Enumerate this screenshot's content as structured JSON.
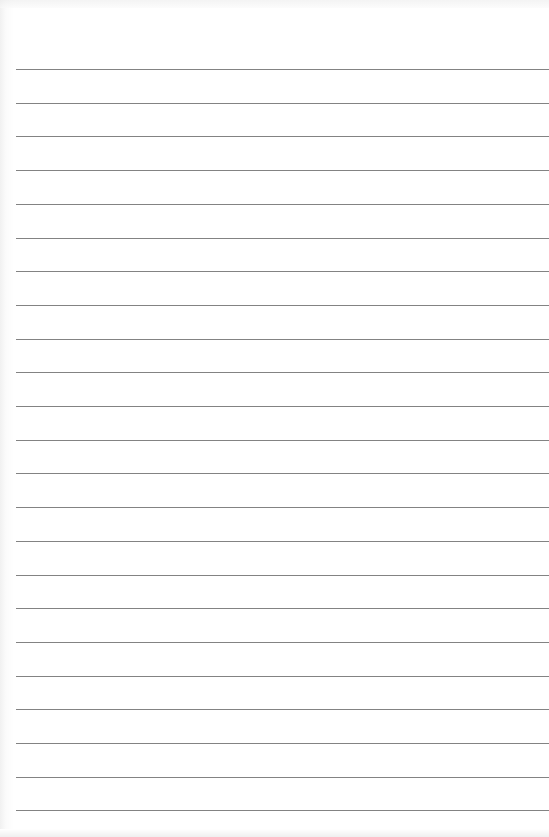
{
  "paper": {
    "type": "lined-notebook-paper",
    "background_color": "#ffffff",
    "line_color": "#6d6d6d",
    "line_count": 23,
    "first_line_y": 69,
    "line_spacing": 33.7,
    "line_left_x": 16
  }
}
